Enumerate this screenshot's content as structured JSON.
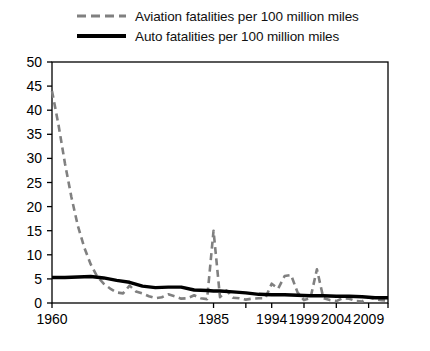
{
  "chart_data": {
    "type": "line",
    "title": "",
    "xlabel": "",
    "ylabel": "",
    "xlim": [
      1960,
      2012
    ],
    "ylim": [
      0,
      50
    ],
    "ytick_step": 5,
    "yticks": [
      0,
      5,
      10,
      15,
      20,
      25,
      30,
      35,
      40,
      45,
      50
    ],
    "xticks": [
      1960,
      1985,
      1994,
      1999,
      2004,
      2009
    ],
    "xtick_labels": [
      "1960",
      "1985",
      "1994",
      "1999",
      "2004",
      "2009"
    ],
    "grid": false,
    "legend_position": "above-plot-left",
    "series": [
      {
        "name": "Aviation fatalities per 100 million miles",
        "style": "dashed",
        "color": "#808080",
        "x": [
          1960,
          1961,
          1962,
          1963,
          1964,
          1965,
          1966,
          1967,
          1968,
          1969,
          1970,
          1971,
          1972,
          1973,
          1974,
          1975,
          1976,
          1977,
          1978,
          1979,
          1980,
          1981,
          1982,
          1983,
          1984,
          1985,
          1986,
          1987,
          1988,
          1989,
          1990,
          1991,
          1992,
          1993,
          1994,
          1995,
          1996,
          1997,
          1998,
          1999,
          2000,
          2001,
          2002,
          2003,
          2004,
          2005,
          2006,
          2007,
          2008,
          2009,
          2010,
          2011,
          2012
        ],
        "values": [
          44.0,
          37.0,
          29.0,
          22.0,
          16.0,
          11.5,
          8.0,
          5.5,
          4.0,
          3.0,
          2.2,
          2.0,
          3.6,
          2.4,
          2.0,
          1.4,
          1.0,
          1.2,
          1.8,
          1.4,
          0.9,
          1.0,
          1.6,
          1.0,
          0.8,
          15.0,
          1.2,
          2.6,
          1.1,
          1.0,
          0.7,
          0.9,
          1.0,
          1.0,
          4.0,
          3.0,
          5.6,
          5.8,
          2.2,
          0.6,
          1.0,
          7.0,
          1.0,
          0.6,
          0.4,
          1.0,
          0.9,
          0.4,
          0.3,
          1.2,
          0.8,
          0.6,
          0.5
        ]
      },
      {
        "name": "Auto fatalities per 100 million miles",
        "style": "solid",
        "color": "#000000",
        "x": [
          1960,
          1962,
          1964,
          1966,
          1968,
          1970,
          1972,
          1974,
          1976,
          1978,
          1980,
          1982,
          1984,
          1985,
          1986,
          1988,
          1990,
          1992,
          1994,
          1996,
          1998,
          2000,
          2002,
          2004,
          2006,
          2008,
          2010,
          2012
        ],
        "values": [
          5.3,
          5.3,
          5.4,
          5.5,
          5.2,
          4.7,
          4.3,
          3.5,
          3.2,
          3.3,
          3.3,
          2.7,
          2.6,
          2.5,
          2.5,
          2.3,
          2.1,
          1.8,
          1.7,
          1.7,
          1.6,
          1.5,
          1.5,
          1.4,
          1.4,
          1.3,
          1.1,
          1.1
        ]
      }
    ]
  }
}
